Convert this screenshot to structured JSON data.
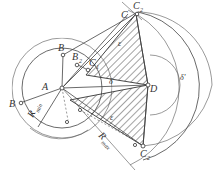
{
  "diagram": {
    "title": "",
    "labels": {
      "A": "A",
      "B": "B",
      "B_left": "B",
      "B2": "B",
      "B2_sub": "2",
      "C": "C",
      "C1": "C",
      "C1_sub": "1",
      "C2_top": "C",
      "C2_top_sub": "2",
      "C2_bottom": "C",
      "C2_bottom_sub": "2",
      "D": "D",
      "epsilon": "ε",
      "delta": "δ",
      "delta_prime": "δ'",
      "R_min": "R",
      "R_min_sub": "min",
      "R_max": "R",
      "R_max_sub": "max"
    }
  }
}
